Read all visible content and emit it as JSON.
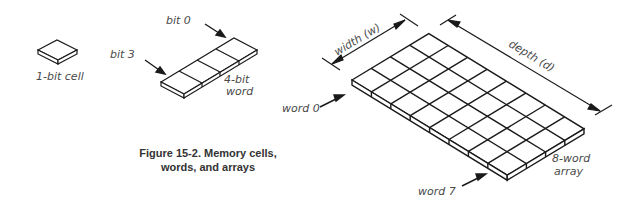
{
  "figure": {
    "caption_line1": "Figure 15-2. Memory cells,",
    "caption_line2": "words, and arrays"
  },
  "labels": {
    "cell": "1-bit cell",
    "bit0": "bit 0",
    "bit3": "bit 3",
    "word4_line1": "4-bit",
    "word4_line2": "word",
    "width": "width (w)",
    "depth": "depth (d)",
    "word0": "word 0",
    "word7": "word 7",
    "array_line1": "8-word",
    "array_line2": "array"
  },
  "array": {
    "width_cells": 4,
    "depth_cells": 8
  },
  "colors": {
    "ink": "#1a1a1a",
    "label": "#4a4a4a",
    "background": "#ffffff"
  }
}
